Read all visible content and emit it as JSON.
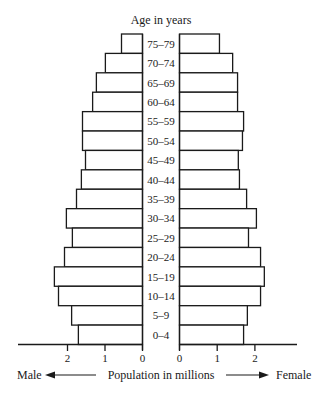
{
  "chart_data": {
    "type": "bar",
    "subtype": "population-pyramid",
    "title": "",
    "y_axis_title": "Age in years",
    "xlabel": "Population in millions",
    "left_label": "Male",
    "right_label": "Female",
    "categories": [
      "75–79",
      "70–74",
      "65–69",
      "60–64",
      "55–59",
      "50–54",
      "45–49",
      "40–44",
      "35–39",
      "30–34",
      "25–29",
      "20–24",
      "15–19",
      "10–14",
      "5–9",
      "0–4"
    ],
    "series": [
      {
        "name": "Male",
        "values": [
          0.56,
          0.99,
          1.23,
          1.33,
          1.6,
          1.6,
          1.52,
          1.63,
          1.76,
          2.03,
          1.87,
          2.08,
          2.35,
          2.24,
          1.89,
          1.71
        ]
      },
      {
        "name": "Female",
        "values": [
          1.06,
          1.41,
          1.54,
          1.54,
          1.7,
          1.67,
          1.56,
          1.59,
          1.78,
          2.04,
          1.83,
          2.15,
          2.25,
          2.15,
          1.8,
          1.7
        ]
      }
    ],
    "male_ticks": [
      "2",
      "1",
      "0"
    ],
    "female_ticks": [
      "0",
      "1",
      "2"
    ],
    "xlim": [
      0,
      3
    ],
    "grid": false,
    "legend": "none"
  }
}
